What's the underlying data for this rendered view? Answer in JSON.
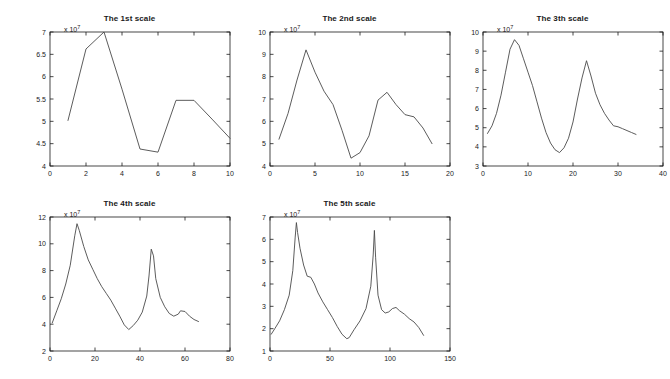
{
  "figure": {
    "background_color": "#ffffff",
    "line_color": "#4a4a4a",
    "axis_color": "#1a1a1a",
    "exponent_label": "x 10",
    "exponent_power": "7"
  },
  "chart_data": [
    {
      "type": "line",
      "title": "The 1st scale",
      "xlabel": "",
      "ylabel": "",
      "y_exponent": "x 10^7",
      "xlim": [
        0,
        10
      ],
      "ylim": [
        4,
        7
      ],
      "xticks": [
        0,
        2,
        4,
        6,
        8,
        10
      ],
      "yticks": [
        4,
        4.5,
        5,
        5.5,
        6,
        6.5,
        7
      ],
      "grid": false,
      "legend": null,
      "x": [
        1,
        2,
        3,
        4,
        5,
        6,
        7,
        8,
        9,
        10
      ],
      "values": [
        5.02,
        6.62,
        7.0,
        5.72,
        4.38,
        4.31,
        5.47,
        5.47,
        5.05,
        4.62
      ]
    },
    {
      "type": "line",
      "title": "The 2nd scale",
      "xlabel": "",
      "ylabel": "",
      "y_exponent": "x 10^7",
      "xlim": [
        0,
        20
      ],
      "ylim": [
        4,
        10
      ],
      "xticks": [
        0,
        5,
        10,
        15,
        20
      ],
      "yticks": [
        4,
        5,
        6,
        7,
        8,
        9,
        10
      ],
      "grid": false,
      "legend": null,
      "x": [
        1,
        2,
        3,
        4,
        5,
        6,
        7,
        8,
        9,
        10,
        11,
        12,
        13,
        14,
        15,
        16,
        17,
        18
      ],
      "values": [
        5.2,
        6.35,
        7.85,
        9.2,
        8.2,
        7.35,
        6.75,
        5.6,
        4.35,
        4.6,
        5.35,
        6.95,
        7.3,
        6.75,
        6.3,
        6.2,
        5.7,
        5.0
      ]
    },
    {
      "type": "line",
      "title": "The 3th scale",
      "xlabel": "",
      "ylabel": "",
      "y_exponent": "x 10^7",
      "xlim": [
        0,
        40
      ],
      "ylim": [
        3,
        10
      ],
      "xticks": [
        0,
        10,
        20,
        30,
        40
      ],
      "yticks": [
        3,
        4,
        5,
        6,
        7,
        8,
        9,
        10
      ],
      "grid": false,
      "legend": null,
      "x": [
        1,
        2,
        3,
        4,
        5,
        6,
        7,
        8,
        9,
        10,
        11,
        12,
        13,
        14,
        15,
        16,
        17,
        18,
        19,
        20,
        21,
        22,
        23,
        24,
        25,
        26,
        27,
        28,
        29,
        30,
        31,
        32,
        33,
        34
      ],
      "values": [
        4.7,
        5.1,
        5.75,
        6.7,
        7.9,
        9.1,
        9.6,
        9.3,
        8.6,
        7.9,
        7.2,
        6.35,
        5.5,
        4.75,
        4.2,
        3.85,
        3.7,
        3.95,
        4.45,
        5.3,
        6.5,
        7.6,
        8.5,
        7.7,
        6.8,
        6.2,
        5.75,
        5.4,
        5.1,
        5.05,
        4.95,
        4.85,
        4.75,
        4.65
      ]
    },
    {
      "type": "line",
      "title": "The 4th scale",
      "xlabel": "",
      "ylabel": "",
      "y_exponent": "x 10^7",
      "xlim": [
        0,
        80
      ],
      "ylim": [
        2,
        12
      ],
      "xticks": [
        0,
        20,
        40,
        60,
        80
      ],
      "yticks": [
        2,
        4,
        6,
        8,
        10,
        12
      ],
      "grid": false,
      "legend": null,
      "x": [
        1,
        3,
        5,
        7,
        9,
        11,
        12,
        13,
        15,
        17,
        19,
        21,
        23,
        25,
        27,
        29,
        31,
        33,
        35,
        37,
        39,
        41,
        43,
        44,
        45,
        46,
        47,
        49,
        51,
        53,
        55,
        57,
        58,
        60,
        62,
        64,
        66
      ],
      "values": [
        4.1,
        5.0,
        5.9,
        7.0,
        8.4,
        10.6,
        11.5,
        11.0,
        9.8,
        8.8,
        8.1,
        7.4,
        6.8,
        6.3,
        5.8,
        5.2,
        4.6,
        3.95,
        3.6,
        3.9,
        4.3,
        4.9,
        6.1,
        7.6,
        9.6,
        9.1,
        7.4,
        6.0,
        5.3,
        4.8,
        4.6,
        4.75,
        5.0,
        4.95,
        4.6,
        4.35,
        4.2
      ]
    },
    {
      "type": "line",
      "title": "The 5th scale",
      "xlabel": "",
      "ylabel": "",
      "y_exponent": "x 10^7",
      "xlim": [
        0,
        150
      ],
      "ylim": [
        1,
        7
      ],
      "xticks": [
        0,
        50,
        100,
        150
      ],
      "yticks": [
        1,
        2,
        3,
        4,
        5,
        6,
        7
      ],
      "grid": false,
      "legend": null,
      "x": [
        1,
        4,
        8,
        12,
        16,
        19,
        21,
        22,
        23,
        25,
        28,
        31,
        34,
        37,
        40,
        44,
        48,
        52,
        56,
        60,
        64,
        66,
        70,
        75,
        80,
        84,
        86,
        87,
        88,
        90,
        93,
        96,
        99,
        102,
        105,
        108,
        112,
        116,
        120,
        124,
        128
      ],
      "values": [
        1.75,
        2.0,
        2.35,
        2.85,
        3.5,
        4.6,
        6.1,
        6.75,
        6.3,
        5.6,
        4.85,
        4.35,
        4.3,
        4.0,
        3.6,
        3.2,
        2.85,
        2.5,
        2.1,
        1.75,
        1.55,
        1.6,
        1.95,
        2.35,
        2.9,
        3.9,
        5.3,
        6.4,
        5.2,
        3.5,
        2.85,
        2.7,
        2.75,
        2.9,
        2.95,
        2.8,
        2.65,
        2.45,
        2.3,
        2.05,
        1.7
      ]
    }
  ]
}
